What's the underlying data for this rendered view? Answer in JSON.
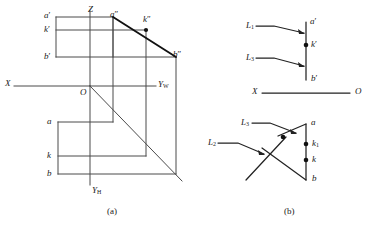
{
  "figure": {
    "ink_color": "#3a3a3a",
    "bold_ink_color": "#111111",
    "background": "#ffffff",
    "captions": [
      {
        "name": "caption-a",
        "text": "(a)",
        "x": 107,
        "y": 206
      },
      {
        "name": "caption-b",
        "text": "(b)",
        "x": 284,
        "y": 206
      }
    ]
  },
  "diagram_a": {
    "name": "projection-diagram-a",
    "axis_labels": [
      {
        "name": "axis-label-z",
        "text": "Z",
        "x": 88,
        "y": 5
      },
      {
        "name": "axis-label-x",
        "text": "X",
        "x": 5,
        "y": 68
      },
      {
        "name": "axis-label-yw",
        "text": "Y",
        "sub": "W",
        "x": 158,
        "y": 69
      },
      {
        "name": "axis-label-yh",
        "text": "Y",
        "sub": "H",
        "x": 92,
        "y": 186
      },
      {
        "name": "origin-label-o",
        "text": "O",
        "x": 83,
        "y": 78
      }
    ],
    "point_labels": [
      {
        "name": "point-label-a-prime",
        "text": "a",
        "prime": "′",
        "x": 44,
        "y": 11
      },
      {
        "name": "point-label-k-prime",
        "text": "k",
        "prime": "′",
        "x": 44,
        "y": 25
      },
      {
        "name": "point-label-b-prime",
        "text": "b",
        "prime": "′",
        "x": 44,
        "y": 52
      },
      {
        "name": "point-label-a-double-prime",
        "text": "a",
        "prime": "″",
        "x": 109,
        "y": 11
      },
      {
        "name": "point-label-k-double-prime",
        "text": "k",
        "prime": "″",
        "x": 142,
        "y": 15
      },
      {
        "name": "point-label-b-double-prime",
        "text": "b",
        "prime": "″",
        "x": 172,
        "y": 52
      },
      {
        "name": "point-label-a",
        "text": "a",
        "x": 47,
        "y": 118
      },
      {
        "name": "point-label-k",
        "text": "k",
        "x": 47,
        "y": 152
      },
      {
        "name": "point-label-b",
        "text": "b",
        "x": 47,
        "y": 170
      }
    ]
  },
  "diagram_b": {
    "name": "projection-diagram-b",
    "axis_labels": [
      {
        "name": "axis-label-x-b",
        "text": "X",
        "x": 252,
        "y": 88
      },
      {
        "name": "axis-label-o-b",
        "text": "O",
        "x": 355,
        "y": 88
      }
    ],
    "point_labels": [
      {
        "name": "point-label-a-prime-b",
        "text": "a",
        "prime": "′",
        "x": 311,
        "y": 21
      },
      {
        "name": "point-label-k-prime-b",
        "text": "k",
        "prime": "′",
        "x": 311,
        "y": 42
      },
      {
        "name": "point-label-b-prime-b",
        "text": "b",
        "prime": "′",
        "x": 311,
        "y": 73
      },
      {
        "name": "point-label-a-b",
        "text": "a",
        "x": 311,
        "y": 121
      },
      {
        "name": "point-label-k1-b",
        "text": "k",
        "sub": "1",
        "x": 312,
        "y": 141
      },
      {
        "name": "point-label-k-b",
        "text": "k",
        "x": 312,
        "y": 157
      },
      {
        "name": "point-label-b-b",
        "text": "b",
        "x": 312,
        "y": 175
      }
    ],
    "leader_labels": [
      {
        "name": "leader-label-l1-top",
        "text": "L",
        "sub": "1",
        "x": 245,
        "y": 22
      },
      {
        "name": "leader-label-l3-top",
        "text": "L",
        "sub": "3",
        "x": 245,
        "y": 54
      },
      {
        "name": "leader-label-l3-bottom",
        "text": "L",
        "sub": "3",
        "x": 240,
        "y": 119
      },
      {
        "name": "leader-label-l2-bottom",
        "text": "L",
        "sub": "2",
        "x": 207,
        "y": 139
      }
    ]
  }
}
